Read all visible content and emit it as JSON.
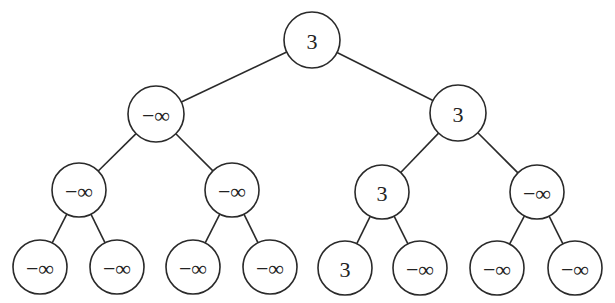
{
  "diagram": {
    "type": "binary-tree",
    "colors": {
      "stroke": "#2a2a2a",
      "fill": "#ffffff",
      "text": "#222222"
    },
    "nodes": [
      {
        "id": "n0",
        "label": "3",
        "x": 312,
        "y": 40,
        "r": 28
      },
      {
        "id": "n1",
        "label": "−∞",
        "x": 156,
        "y": 114,
        "r": 28
      },
      {
        "id": "n2",
        "label": "3",
        "x": 458,
        "y": 113,
        "r": 28
      },
      {
        "id": "n3",
        "label": "−∞",
        "x": 79,
        "y": 190,
        "r": 27
      },
      {
        "id": "n4",
        "label": "−∞",
        "x": 232,
        "y": 190,
        "r": 27
      },
      {
        "id": "n5",
        "label": "3",
        "x": 382,
        "y": 192,
        "r": 27
      },
      {
        "id": "n6",
        "label": "−∞",
        "x": 537,
        "y": 192,
        "r": 27
      },
      {
        "id": "n7",
        "label": "−∞",
        "x": 40,
        "y": 267,
        "r": 27
      },
      {
        "id": "n8",
        "label": "−∞",
        "x": 117,
        "y": 267,
        "r": 27
      },
      {
        "id": "n9",
        "label": "−∞",
        "x": 193,
        "y": 267,
        "r": 27
      },
      {
        "id": "n10",
        "label": "−∞",
        "x": 270,
        "y": 267,
        "r": 27
      },
      {
        "id": "n11",
        "label": "3",
        "x": 345,
        "y": 268,
        "r": 27
      },
      {
        "id": "n12",
        "label": "−∞",
        "x": 420,
        "y": 268,
        "r": 27
      },
      {
        "id": "n13",
        "label": "−∞",
        "x": 497,
        "y": 268,
        "r": 27
      },
      {
        "id": "n14",
        "label": "−∞",
        "x": 575,
        "y": 268,
        "r": 27
      }
    ],
    "edges": [
      [
        "n0",
        "n1"
      ],
      [
        "n0",
        "n2"
      ],
      [
        "n1",
        "n3"
      ],
      [
        "n1",
        "n4"
      ],
      [
        "n2",
        "n5"
      ],
      [
        "n2",
        "n6"
      ],
      [
        "n3",
        "n7"
      ],
      [
        "n3",
        "n8"
      ],
      [
        "n4",
        "n9"
      ],
      [
        "n4",
        "n10"
      ],
      [
        "n5",
        "n11"
      ],
      [
        "n5",
        "n12"
      ],
      [
        "n6",
        "n13"
      ],
      [
        "n6",
        "n14"
      ]
    ]
  }
}
